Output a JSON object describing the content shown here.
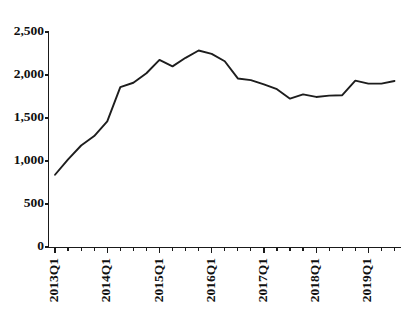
{
  "chart_data": {
    "type": "line",
    "title": "",
    "subtitle": "",
    "xlabel": "",
    "ylabel": "",
    "grid": false,
    "legend": false,
    "ylim": [
      0,
      2500
    ],
    "yticks": [
      0,
      500,
      1000,
      1500,
      2000,
      2500
    ],
    "ytick_labels": [
      "0",
      "500",
      "1,000",
      "1,500",
      "2,000",
      "2,500"
    ],
    "x": [
      "2013Q1",
      "2013Q2",
      "2013Q3",
      "2013Q4",
      "2014Q1",
      "2014Q2",
      "2014Q3",
      "2014Q4",
      "2015Q1",
      "2015Q2",
      "2015Q3",
      "2015Q4",
      "2016Q1",
      "2016Q2",
      "2016Q3",
      "2016Q4",
      "2017Q1",
      "2017Q2",
      "2017Q3",
      "2017Q4",
      "2018Q1",
      "2018Q2",
      "2018Q3",
      "2018Q4",
      "2019Q1",
      "2019Q2",
      "2019Q3"
    ],
    "xtick_labels_shown": [
      "2013Q1",
      "2014Q1",
      "2015Q1",
      "2016Q1",
      "2017Q1",
      "2018Q1",
      "2019Q1"
    ],
    "xtick_label_rotation": -90,
    "xtick_label_interval": 4,
    "series": [
      {
        "name": "",
        "color": "#1d1d1d",
        "values": [
          840,
          1020,
          1180,
          1290,
          1460,
          1860,
          1910,
          2020,
          2175,
          2100,
          2200,
          2285,
          2245,
          2160,
          1960,
          1940,
          1890,
          1835,
          1725,
          1775,
          1745,
          1760,
          1765,
          1935,
          1900,
          1900,
          1930
        ]
      }
    ]
  },
  "axis": {
    "y_axis_name": "vertical-value-axis",
    "x_axis_name": "horizontal-time-axis"
  }
}
